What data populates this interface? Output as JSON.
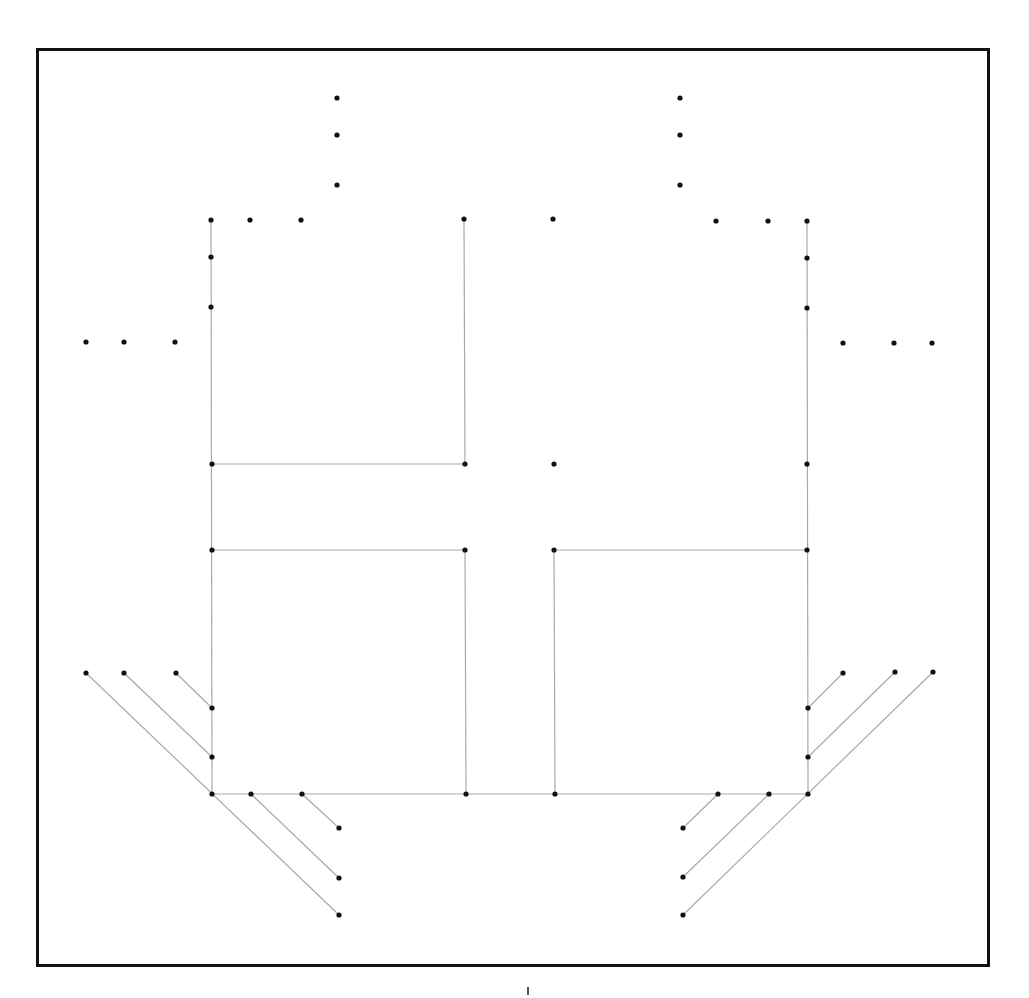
{
  "diagram": {
    "frame": {
      "x": 36,
      "y": 48,
      "width": 951,
      "height": 916,
      "border_color": "#111111",
      "border_width": 3
    },
    "style": {
      "edge_color": "#a9a9a9",
      "node_color": "#111111",
      "node_radius": 2.6
    },
    "nodes": [
      {
        "id": "tl-v1",
        "x": 337,
        "y": 98
      },
      {
        "id": "tl-v2",
        "x": 337,
        "y": 135
      },
      {
        "id": "tl-v3",
        "x": 337,
        "y": 185
      },
      {
        "id": "tr-v1",
        "x": 680,
        "y": 98
      },
      {
        "id": "tr-v2",
        "x": 680,
        "y": 135
      },
      {
        "id": "tr-v3",
        "x": 680,
        "y": 185
      },
      {
        "id": "L-top",
        "x": 211,
        "y": 220
      },
      {
        "id": "t-h1",
        "x": 250,
        "y": 220
      },
      {
        "id": "t-h2",
        "x": 301,
        "y": 220
      },
      {
        "id": "C1-top",
        "x": 464,
        "y": 219
      },
      {
        "id": "C2-top",
        "x": 553,
        "y": 219
      },
      {
        "id": "t-h3",
        "x": 716,
        "y": 221
      },
      {
        "id": "t-h4",
        "x": 768,
        "y": 221
      },
      {
        "id": "R-top",
        "x": 807,
        "y": 221
      },
      {
        "id": "L-2",
        "x": 211,
        "y": 257
      },
      {
        "id": "L-3",
        "x": 211,
        "y": 307
      },
      {
        "id": "R-2",
        "x": 807,
        "y": 258
      },
      {
        "id": "R-3",
        "x": 807,
        "y": 308
      },
      {
        "id": "ml-1",
        "x": 86,
        "y": 342
      },
      {
        "id": "ml-2",
        "x": 124,
        "y": 342
      },
      {
        "id": "ml-3",
        "x": 175,
        "y": 342
      },
      {
        "id": "mr-1",
        "x": 843,
        "y": 343
      },
      {
        "id": "mr-2",
        "x": 894,
        "y": 343
      },
      {
        "id": "mr-3",
        "x": 932,
        "y": 343
      },
      {
        "id": "L-464",
        "x": 212,
        "y": 464
      },
      {
        "id": "C1-464",
        "x": 465,
        "y": 464
      },
      {
        "id": "C2-464",
        "x": 554,
        "y": 464
      },
      {
        "id": "R-464",
        "x": 807,
        "y": 464
      },
      {
        "id": "L-550",
        "x": 212,
        "y": 550
      },
      {
        "id": "C1-550",
        "x": 465,
        "y": 550
      },
      {
        "id": "C2-550",
        "x": 554,
        "y": 550
      },
      {
        "id": "R-550",
        "x": 807,
        "y": 550
      },
      {
        "id": "bl-1",
        "x": 86,
        "y": 673
      },
      {
        "id": "bl-2",
        "x": 124,
        "y": 673
      },
      {
        "id": "bl-3",
        "x": 176,
        "y": 673
      },
      {
        "id": "br-1",
        "x": 843,
        "y": 673
      },
      {
        "id": "br-2",
        "x": 895,
        "y": 672
      },
      {
        "id": "br-3",
        "x": 933,
        "y": 672
      },
      {
        "id": "L-708",
        "x": 212,
        "y": 708
      },
      {
        "id": "L-757",
        "x": 212,
        "y": 757
      },
      {
        "id": "R-708",
        "x": 808,
        "y": 708
      },
      {
        "id": "R-757",
        "x": 808,
        "y": 757
      },
      {
        "id": "L-bot",
        "x": 212,
        "y": 794
      },
      {
        "id": "b-h1",
        "x": 251,
        "y": 794
      },
      {
        "id": "b-h2",
        "x": 302,
        "y": 794
      },
      {
        "id": "C1-bot",
        "x": 466,
        "y": 794
      },
      {
        "id": "C2-bot",
        "x": 555,
        "y": 794
      },
      {
        "id": "b-h3",
        "x": 718,
        "y": 794
      },
      {
        "id": "b-h4",
        "x": 769,
        "y": 794
      },
      {
        "id": "R-bot",
        "x": 808,
        "y": 794
      },
      {
        "id": "bbl-1",
        "x": 339,
        "y": 828
      },
      {
        "id": "bbl-2",
        "x": 339,
        "y": 878
      },
      {
        "id": "bbl-3",
        "x": 339,
        "y": 915
      },
      {
        "id": "bbr-1",
        "x": 683,
        "y": 828
      },
      {
        "id": "bbr-2",
        "x": 683,
        "y": 877
      },
      {
        "id": "bbr-3",
        "x": 683,
        "y": 915
      }
    ],
    "edges": [
      {
        "from": [
          211,
          220
        ],
        "to": [
          212,
          794
        ]
      },
      {
        "from": [
          807,
          221
        ],
        "to": [
          808,
          794
        ]
      },
      {
        "from": [
          464,
          219
        ],
        "to": [
          465,
          464
        ]
      },
      {
        "from": [
          212,
          464
        ],
        "to": [
          465,
          464
        ]
      },
      {
        "from": [
          212,
          550
        ],
        "to": [
          465,
          550
        ]
      },
      {
        "from": [
          465,
          550
        ],
        "to": [
          466,
          794
        ]
      },
      {
        "from": [
          554,
          550
        ],
        "to": [
          807,
          550
        ]
      },
      {
        "from": [
          554,
          550
        ],
        "to": [
          555,
          794
        ]
      },
      {
        "from": [
          212,
          794
        ],
        "to": [
          808,
          794
        ]
      },
      {
        "from": [
          86,
          673
        ],
        "to": [
          339,
          915
        ]
      },
      {
        "from": [
          124,
          673
        ],
        "to": [
          212,
          757
        ]
      },
      {
        "from": [
          176,
          673
        ],
        "to": [
          212,
          708
        ]
      },
      {
        "from": [
          251,
          794
        ],
        "to": [
          339,
          878
        ]
      },
      {
        "from": [
          302,
          794
        ],
        "to": [
          339,
          828
        ]
      },
      {
        "from": [
          933,
          672
        ],
        "to": [
          683,
          915
        ]
      },
      {
        "from": [
          895,
          672
        ],
        "to": [
          808,
          757
        ]
      },
      {
        "from": [
          843,
          673
        ],
        "to": [
          808,
          708
        ]
      },
      {
        "from": [
          769,
          794
        ],
        "to": [
          683,
          877
        ]
      },
      {
        "from": [
          718,
          794
        ],
        "to": [
          683,
          828
        ]
      }
    ],
    "footer_tick": {
      "x": 528,
      "y": 987,
      "height": 8
    }
  }
}
